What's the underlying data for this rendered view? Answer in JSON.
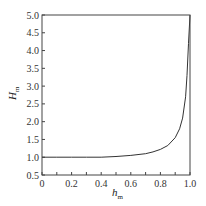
{
  "chart_data": {
    "type": "line",
    "title": "",
    "xlabel": "h_m",
    "ylabel": "H_m",
    "xlim": [
      0,
      1.0
    ],
    "ylim": [
      0.5,
      5.0
    ],
    "grid": false,
    "legend": null,
    "x_ticks": [
      "0",
      "0.2",
      "0.4",
      "0.6",
      "0.8",
      "1.0"
    ],
    "y_ticks": [
      "0.5",
      "1.0",
      "1.5",
      "2.0",
      "2.5",
      "3.0",
      "3.5",
      "4.0",
      "4.5",
      "5.0"
    ],
    "series": [
      {
        "name": "H_m vs h_m",
        "x": [
          0,
          0.1,
          0.2,
          0.3,
          0.4,
          0.5,
          0.6,
          0.7,
          0.75,
          0.8,
          0.85,
          0.9,
          0.93,
          0.95,
          0.97,
          0.98,
          0.99,
          1.0
        ],
        "y": [
          1.0,
          1.0,
          1.0,
          1.0,
          1.0,
          1.02,
          1.05,
          1.1,
          1.15,
          1.22,
          1.33,
          1.55,
          1.8,
          2.1,
          2.7,
          3.3,
          4.2,
          5.0
        ]
      }
    ]
  },
  "labels": {
    "xlabel_main": "h",
    "xlabel_sub": "m",
    "ylabel_main": "H",
    "ylabel_sub": "m"
  }
}
